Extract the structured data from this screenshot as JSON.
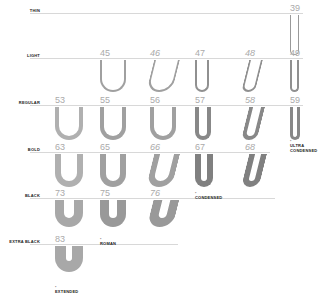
{
  "rows": [
    {
      "label": "THIN",
      "y": 13,
      "line_x0": 30,
      "line_x1": 303
    },
    {
      "label": "LIGHT",
      "y": 58,
      "line_x0": 30,
      "line_x1": 303
    },
    {
      "label": "REGULAR",
      "y": 105,
      "line_x0": 30,
      "line_x1": 303
    },
    {
      "label": "BOLD",
      "y": 152,
      "line_x0": 30,
      "line_x1": 270
    },
    {
      "label": "BLACK",
      "y": 198,
      "line_x0": 30,
      "line_x1": 275
    },
    {
      "label": "EXTRA BLACK",
      "y": 244,
      "line_x0": 30,
      "line_x1": 178
    }
  ],
  "cells": [
    {
      "num": "39",
      "row": 0,
      "x": 290,
      "w": 9,
      "h": 40,
      "stroke": 1,
      "italic": false,
      "color": "#999999"
    },
    {
      "num": "45",
      "row": 1,
      "x": 100,
      "w": 26,
      "h": 32,
      "stroke": 2,
      "italic": false,
      "color": "#a0a0a0"
    },
    {
      "num": "46",
      "row": 1,
      "x": 150,
      "w": 26,
      "h": 32,
      "stroke": 2,
      "italic": true,
      "color": "#a0a0a0"
    },
    {
      "num": "47",
      "row": 1,
      "x": 195,
      "w": 14,
      "h": 32,
      "stroke": 2,
      "italic": false,
      "color": "#909090"
    },
    {
      "num": "48",
      "row": 1,
      "x": 245,
      "w": 14,
      "h": 32,
      "stroke": 2,
      "italic": true,
      "color": "#909090"
    },
    {
      "num": "49",
      "row": 1,
      "x": 290,
      "w": 9,
      "h": 32,
      "stroke": 2,
      "italic": false,
      "color": "#909090"
    },
    {
      "num": "53",
      "row": 2,
      "x": 55,
      "w": 28,
      "h": 33,
      "stroke": 4,
      "italic": false,
      "color": "#b0b0b0"
    },
    {
      "num": "55",
      "row": 2,
      "x": 100,
      "w": 26,
      "h": 33,
      "stroke": 4,
      "italic": false,
      "color": "#a0a0a0"
    },
    {
      "num": "56",
      "row": 2,
      "x": 150,
      "w": 26,
      "h": 33,
      "stroke": 4,
      "italic": false,
      "color": "#a0a0a0"
    },
    {
      "num": "57",
      "row": 2,
      "x": 195,
      "w": 16,
      "h": 33,
      "stroke": 4,
      "italic": false,
      "color": "#888888"
    },
    {
      "num": "58",
      "row": 2,
      "x": 245,
      "w": 16,
      "h": 33,
      "stroke": 4,
      "italic": true,
      "color": "#888888"
    },
    {
      "num": "59",
      "row": 2,
      "x": 290,
      "w": 10,
      "h": 33,
      "stroke": 3,
      "italic": false,
      "color": "#888888"
    },
    {
      "num": "63",
      "row": 3,
      "x": 55,
      "w": 28,
      "h": 33,
      "stroke": 6,
      "italic": false,
      "color": "#b0b0b0"
    },
    {
      "num": "65",
      "row": 3,
      "x": 100,
      "w": 26,
      "h": 33,
      "stroke": 6,
      "italic": false,
      "color": "#a0a0a0"
    },
    {
      "num": "66",
      "row": 3,
      "x": 150,
      "w": 26,
      "h": 33,
      "stroke": 6,
      "italic": true,
      "color": "#a0a0a0"
    },
    {
      "num": "67",
      "row": 3,
      "x": 195,
      "w": 18,
      "h": 33,
      "stroke": 6,
      "italic": false,
      "color": "#808080"
    },
    {
      "num": "68",
      "row": 3,
      "x": 245,
      "w": 18,
      "h": 33,
      "stroke": 6,
      "italic": true,
      "color": "#808080"
    },
    {
      "num": "73",
      "row": 4,
      "x": 55,
      "w": 28,
      "h": 27,
      "stroke": 9,
      "italic": false,
      "color": "#a8a8a8"
    },
    {
      "num": "75",
      "row": 4,
      "x": 100,
      "w": 26,
      "h": 27,
      "stroke": 9,
      "italic": false,
      "color": "#999999"
    },
    {
      "num": "76",
      "row": 4,
      "x": 150,
      "w": 26,
      "h": 27,
      "stroke": 9,
      "italic": true,
      "color": "#999999"
    },
    {
      "num": "83",
      "row": 5,
      "x": 55,
      "w": 28,
      "h": 26,
      "stroke": 11,
      "italic": false,
      "color": "#a8a8a8"
    }
  ],
  "tags": [
    {
      "text": "ULTRA CONDENSED",
      "x": 290,
      "y": 138
    },
    {
      "text": "CONDENSED",
      "x": 195,
      "y": 190
    },
    {
      "text": "ROMAN",
      "x": 100,
      "y": 236
    },
    {
      "text": "EXTENDED",
      "x": 55,
      "y": 284
    }
  ]
}
